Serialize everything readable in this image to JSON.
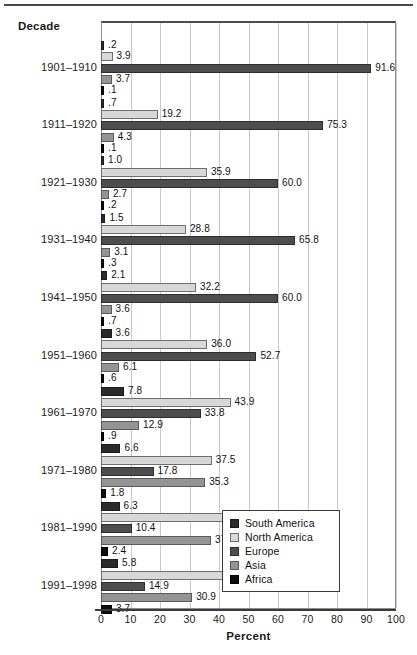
{
  "chart_data": {
    "type": "bar",
    "orientation": "horizontal",
    "title": "",
    "xlabel": "Percent",
    "ylabel": "Decade",
    "xlim": [
      0,
      100
    ],
    "xticks": [
      "0",
      "10",
      "20",
      "30",
      "40",
      "50",
      "60",
      "70",
      "80",
      "90",
      "100"
    ],
    "grid": true,
    "legend_position": "inside-right-lower",
    "categories": [
      "1901–1910",
      "1911–1920",
      "1921–1930",
      "1931–1940",
      "1941–1950",
      "1951–1960",
      "1961–1970",
      "1971–1980",
      "1981–1990",
      "1991–1998"
    ],
    "series": [
      {
        "name": "South America",
        "color": "#2b2b2b",
        "values": [
          0.2,
          0.7,
          1.0,
          1.5,
          2.1,
          3.6,
          7.8,
          6.6,
          6.3,
          5.8
        ],
        "labels": [
          ".2",
          ".7",
          "1.0",
          "1.5",
          "2.1",
          "3.6",
          "7.8",
          "6.6",
          "6.3",
          "5.8"
        ]
      },
      {
        "name": "North America",
        "color": "#d8d8d8",
        "values": [
          3.9,
          19.2,
          35.9,
          28.8,
          32.2,
          36.0,
          43.9,
          37.5,
          43.0,
          43.8
        ],
        "labels": [
          "3.9",
          "19.2",
          "35.9",
          "28.8",
          "32.2",
          "36.0",
          "43.9",
          "37.5",
          "43.0",
          "43.8"
        ]
      },
      {
        "name": "Europe",
        "color": "#4d4d4d",
        "values": [
          91.6,
          75.3,
          60.0,
          65.8,
          60.0,
          52.7,
          33.8,
          17.8,
          10.4,
          14.9
        ],
        "labels": [
          "91.6",
          "75.3",
          "60.0",
          "65.8",
          "60.0",
          "52.7",
          "33.8",
          "17.8",
          "10.4",
          "14.9"
        ]
      },
      {
        "name": "Asia",
        "color": "#949494",
        "values": [
          3.7,
          4.3,
          2.7,
          3.1,
          3.6,
          6.1,
          12.9,
          35.3,
          37.3,
          30.9
        ],
        "labels": [
          "3.7",
          "4.3",
          "2.7",
          "3.1",
          "3.6",
          "6.1",
          "12.9",
          "35.3",
          "37.3",
          "30.9"
        ]
      },
      {
        "name": "Africa",
        "color": "#0d0d0d",
        "values": [
          0.1,
          0.1,
          0.2,
          0.3,
          0.7,
          0.6,
          0.9,
          1.8,
          2.4,
          3.7
        ],
        "labels": [
          ".1",
          ".1",
          ".2",
          ".3",
          ".7",
          ".6",
          ".9",
          "1.8",
          "2.4",
          "3.7"
        ]
      }
    ]
  },
  "axis": {
    "y_header": "Decade",
    "x_title": "Percent"
  },
  "legend": {
    "items": [
      {
        "label": "South America",
        "swatch": "#2b2b2b"
      },
      {
        "label": "North America",
        "swatch": "#d8d8d8"
      },
      {
        "label": "Europe",
        "swatch": "#4d4d4d"
      },
      {
        "label": "Asia",
        "swatch": "#949494"
      },
      {
        "label": "Africa",
        "swatch": "#0d0d0d"
      }
    ]
  }
}
